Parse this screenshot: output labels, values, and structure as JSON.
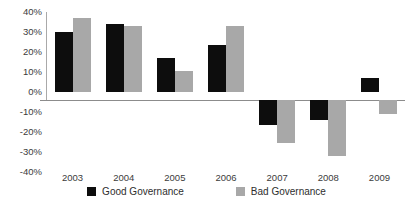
{
  "chart_data": {
    "type": "bar",
    "title": "",
    "subtitle": "",
    "xlabel": "",
    "ylabel": "",
    "categories": [
      "2003",
      "2004",
      "2005",
      "2006",
      "2007",
      "2008",
      "2009"
    ],
    "series": [
      {
        "name": "Good Governance",
        "color": "#0d0d0d",
        "values": [
          30,
          34,
          17,
          23.5,
          -12.5,
          -10,
          7
        ]
      },
      {
        "name": "Bad Governance",
        "color": "#a8a8a8",
        "values": [
          37,
          33,
          10.5,
          33,
          -21.5,
          -28,
          -7
        ]
      }
    ],
    "ylim": [
      -40,
      40
    ],
    "ytick_values": [
      40,
      30,
      20,
      10,
      0,
      -10,
      -20,
      -30,
      -40
    ],
    "ytick_labels": [
      "40%",
      "30%",
      "20%",
      "10%",
      "0%",
      "-10%",
      "-20%",
      "-30%",
      "-40%"
    ],
    "grid": false,
    "legend_position": "bottom",
    "annotations": []
  },
  "legend": {
    "items": [
      {
        "label": "Good Governance",
        "swatch": "good"
      },
      {
        "label": "Bad Governance",
        "swatch": "bad"
      }
    ]
  }
}
